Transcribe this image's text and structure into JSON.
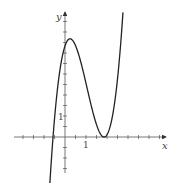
{
  "chart_data": {
    "type": "line",
    "title": "",
    "xlabel": "x",
    "ylabel": "y",
    "tick_labels": {
      "x": [
        "1"
      ],
      "y": [
        "1"
      ]
    },
    "tick_interval": 0.5,
    "xlim": [
      -2.4,
      4.8
    ],
    "ylim": [
      -1.7,
      6.0
    ],
    "grid": false,
    "legend": null,
    "series": [
      {
        "name": "f(x)",
        "description": "cubic with simple root near x=-0.57, local max ~ (0.24, 4.5), double root / local min at x~1.86",
        "x": [
          -0.78,
          -0.57,
          -0.3,
          0,
          0.24,
          0.6,
          1.0,
          1.4,
          1.86,
          2.2,
          2.5,
          2.78
        ],
        "y": [
          -1.5,
          0,
          2.35,
          4.35,
          4.6,
          3.8,
          2.4,
          0.95,
          0,
          0.67,
          2.3,
          5.45
        ]
      }
    ]
  },
  "axes": {
    "x_label": "x",
    "y_label": "y",
    "x_tick_label": "1",
    "y_tick_label": "1"
  }
}
